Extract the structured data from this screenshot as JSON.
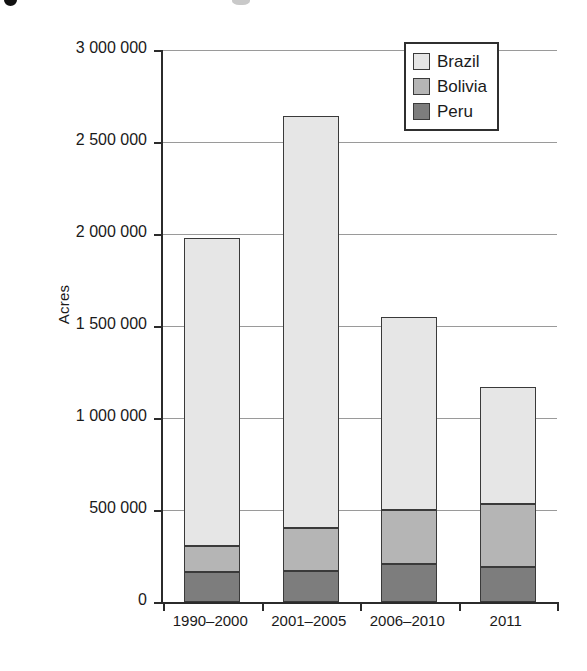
{
  "figure": {
    "y_axis_title": "Acres"
  },
  "legend": {
    "entries": [
      {
        "label": "Brazil",
        "color": "#e6e6e6"
      },
      {
        "label": "Bolivia",
        "color": "#b5b5b5"
      },
      {
        "label": "Peru",
        "color": "#7d7d7d"
      }
    ]
  },
  "axes": {
    "y_tick_labels": [
      "3 000 000",
      "2 500 000",
      "2 000 000",
      "1 500 000",
      "1 000 000",
      "500 000",
      "0"
    ],
    "x_tick_labels": [
      "1990–2000",
      "2001–2005",
      "2006–2010",
      "2011"
    ]
  },
  "chart_data": {
    "type": "bar",
    "stacked": true,
    "title": "",
    "xlabel": "",
    "ylabel": "Acres",
    "ylim": [
      0,
      3000000
    ],
    "ytick_values": [
      0,
      500000,
      1000000,
      1500000,
      2000000,
      2500000,
      3000000
    ],
    "ytick_labels": [
      "0",
      "500 000",
      "1 000 000",
      "1 500 000",
      "2 000 000",
      "2 500 000",
      "3 000 000"
    ],
    "grid": "horizontal",
    "legend_position": "top-right",
    "categories": [
      "1990–2000",
      "2001–2005",
      "2006–2010",
      "2011"
    ],
    "series": [
      {
        "name": "Peru",
        "color": "#7d7d7d",
        "values": [
          165000,
          170000,
          205000,
          190000
        ]
      },
      {
        "name": "Bolivia",
        "color": "#b5b5b5",
        "values": [
          140000,
          230000,
          295000,
          345000
        ]
      },
      {
        "name": "Brazil",
        "color": "#e6e6e6",
        "values": [
          1675000,
          2240000,
          1050000,
          635000
        ]
      }
    ],
    "cumulative_tops": {
      "Peru": [
        165000,
        170000,
        205000,
        190000
      ],
      "Bolivia": [
        305000,
        400000,
        500000,
        535000
      ],
      "Brazil": [
        1980000,
        2640000,
        1550000,
        1170000
      ]
    },
    "totals": [
      1980000,
      2640000,
      1550000,
      1170000
    ]
  }
}
